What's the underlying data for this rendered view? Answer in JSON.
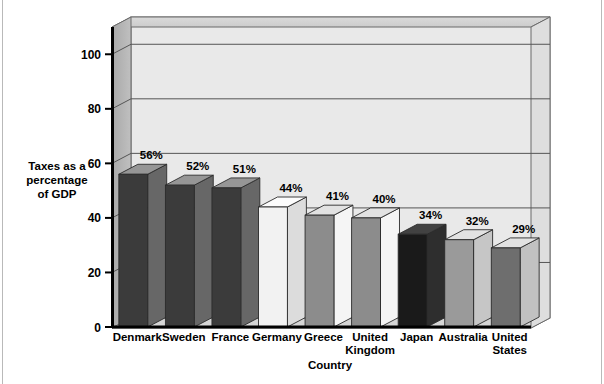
{
  "chart_data": {
    "type": "bar",
    "title": "",
    "subtitle": "",
    "xlabel": "Country",
    "ylabel": "Taxes as a percentage of GDP",
    "ylabel_lines": [
      "Taxes as a",
      "percentage",
      "of GDP"
    ],
    "categories": [
      "Denmark",
      "Sweden",
      "France",
      "Germany",
      "Greece",
      "United Kingdom",
      "Japan",
      "Australia",
      "United States"
    ],
    "category_lines": [
      [
        "Denmark"
      ],
      [
        "Sweden"
      ],
      [
        "France"
      ],
      [
        "Germany"
      ],
      [
        "Greece"
      ],
      [
        "United",
        "Kingdom"
      ],
      [
        "Japan"
      ],
      [
        "Australia"
      ],
      [
        "United",
        "States"
      ]
    ],
    "values": [
      56,
      52,
      51,
      44,
      41,
      40,
      34,
      32,
      29
    ],
    "value_labels": [
      "56%",
      "52%",
      "51%",
      "44%",
      "41%",
      "40%",
      "34%",
      "32%",
      "29%"
    ],
    "bar_colors": [
      "#3b3b3b",
      "#3b3b3b",
      "#3b3b3b",
      "#f2f2f2",
      "#8c8c8c",
      "#8c8c8c",
      "#1a1a1a",
      "#9a9a9a",
      "#6e6e6e"
    ],
    "ylim": [
      0,
      110
    ],
    "yticks": [
      0,
      20,
      40,
      60,
      80,
      100
    ],
    "ytick_labels": [
      "0",
      "20",
      "40",
      "60",
      "80",
      "100"
    ],
    "grid": true,
    "grid_color": "#555555",
    "legend": "none",
    "plot_bg": "#e9e9e9",
    "wall_side_color": "#b0b0b0",
    "wall_top_color": "#d2d2d2",
    "axis_color": "#000000",
    "units": "percent of GDP"
  }
}
